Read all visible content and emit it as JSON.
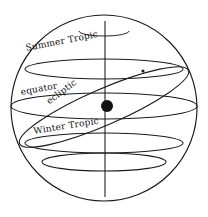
{
  "diagram": {
    "background_color": "#ffffff",
    "stroke_color": "#1a1a1a",
    "fill_color": "#111111",
    "width": 208,
    "height": 217,
    "sphere": {
      "name": "celestial-sphere-outline",
      "center_x": 104,
      "center_y": 108,
      "radius": 93
    },
    "axis": {
      "name": "polar-axis",
      "x": 105,
      "y_top": 21,
      "y_bottom": 197
    },
    "earth": {
      "name": "earth-center-dot",
      "cx": 107,
      "cy": 106,
      "r": 6
    },
    "ecliptic_marker": {
      "cx": 143,
      "cy": 71,
      "r": 1.6
    },
    "circles": [
      {
        "id": "arctic-circle",
        "cy": 31,
        "rx": 25,
        "ry": 5,
        "partial": true
      },
      {
        "id": "summer-tropic",
        "cy": 69,
        "rx": 79,
        "ry": 10,
        "partial": false
      },
      {
        "id": "equator",
        "cy": 106,
        "rx": 93,
        "ry": 13,
        "partial": false
      },
      {
        "id": "winter-tropic",
        "cy": 143,
        "rx": 79,
        "ry": 10,
        "partial": false
      },
      {
        "id": "antarctic-circle",
        "cy": 162,
        "rx": 62,
        "ry": 9,
        "partial": false
      }
    ],
    "ecliptic": {
      "id": "ecliptic-ellipse",
      "cx": 104,
      "cy": 107,
      "rx": 92,
      "ry": 18,
      "tilt_deg": -23.5
    },
    "labels": [
      {
        "id": "summer-tropic-label",
        "text": "Summer Tropic",
        "x": 25,
        "y": 44,
        "rotate": -11
      },
      {
        "id": "equator-label",
        "text": "equator",
        "x": 20,
        "y": 88,
        "rotate": -10
      },
      {
        "id": "ecliptic-label",
        "text": "ecliptic",
        "x": 45,
        "y": 99,
        "rotate": -37
      },
      {
        "id": "winter-tropic-label",
        "text": "Winter Tropic",
        "x": 33,
        "y": 127,
        "rotate": -9
      }
    ]
  }
}
